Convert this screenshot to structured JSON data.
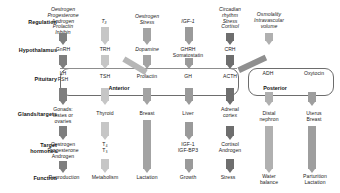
{
  "diagram": {
    "row_labels": [
      {
        "id": "regulation",
        "label": "Regulation",
        "y": 22
      },
      {
        "id": "hypothalamus",
        "label": "Hypothalamus",
        "y": 50
      },
      {
        "id": "pituitary",
        "label": "Pituitary",
        "y": 78
      },
      {
        "id": "glands",
        "label": "Glands/targets",
        "y": 113
      },
      {
        "id": "target-hormones",
        "label": "Target\nhormones",
        "y": 145
      },
      {
        "id": "function",
        "label": "Function",
        "y": 177
      }
    ],
    "boxes": [
      {
        "id": "anterior-pituitary",
        "label": "Anterior",
        "x": 60,
        "y": 68,
        "w": 177,
        "h": 26,
        "label_x": 118,
        "label_y": 86
      },
      {
        "id": "posterior-pituitary",
        "label": "Posterior",
        "x": 248,
        "y": 68,
        "w": 84,
        "h": 26,
        "label_x": 268,
        "label_y": 86
      }
    ],
    "columns": [
      {
        "id": "gonadal-axis",
        "x": 62,
        "regulation": "Oestrogen\nProgesterone\nAndrogen\nProlactin\nInhibin",
        "regulation_style": "italic",
        "hypothalamus": "GnRH",
        "pituitary": "LH\nFSH",
        "gland": "Gonads:\ntestes or\novaries",
        "target_hormone": "Oestrogen\nProgesterone\nAndrogen",
        "function": "Reproduction",
        "arrow_color": "#7e7e7e"
      },
      {
        "id": "thyroid-axis",
        "x": 104,
        "regulation": "T₃",
        "regulation_style": "italic",
        "hypothalamus": "TRH",
        "pituitary": "TSH",
        "gland": "Thyroid",
        "target_hormone": "T₄\nT₃",
        "function": "Metabolism",
        "arrow_color": "#c6c6c6"
      },
      {
        "id": "prolactin-axis",
        "x": 146,
        "regulation": "Oestrogen\nStress",
        "regulation_style": "italic",
        "hypothalamus": "Dopamine",
        "hypothalamus_style": "italic",
        "pituitary": "Prolactin",
        "gland": "Breast",
        "target_hormone": "",
        "function": "Lactation",
        "arrow_color": "#a3a3a3"
      },
      {
        "id": "growth-hormone-axis",
        "x": 188,
        "regulation": "IGF-1",
        "regulation_style": "italic",
        "hypothalamus": "GHRH\nSomatostatin",
        "pituitary": "GH",
        "gland": "Liver",
        "target_hormone": "IGF-1\nIGF-BP3",
        "function": "Growth",
        "arrow_color": "#9a9a9a"
      },
      {
        "id": "adrenal-axis",
        "x": 229,
        "regulation": "Circadian\nrhythm\nStress\nCortisol",
        "regulation_style": "italic",
        "hypothalamus": "CRH",
        "pituitary": "ACTH",
        "gland": "Adrenal\ncortex",
        "target_hormone": "Cortisol\nAndrogen",
        "function": "Stress",
        "arrow_color": "#6e6e6e"
      },
      {
        "id": "adh-axis",
        "x": 268,
        "regulation": "Osmolality\nIntravascular\nvolume",
        "regulation_style": "italic",
        "hypothalamus": "",
        "pituitary": "ADH",
        "gland": "Distal\nnephron",
        "target_hormone": "",
        "function": "Water\nbalance",
        "arrow_color": "#b0b0b0"
      },
      {
        "id": "oxytocin-axis",
        "x": 311,
        "regulation": "",
        "hypothalamus": "",
        "pituitary": "Oxytocin",
        "gland": "Uterus\nBreast",
        "target_hormone": "",
        "function": "Parturition\nLactation",
        "arrow_color": "#9e9e9e"
      }
    ],
    "diagonal_arrows": [
      {
        "id": "dopamine-to-prolactin",
        "from": "hypothalamus-dopamine",
        "to": "pituitary-prolactin"
      },
      {
        "id": "adh-to-posterior",
        "from": "hypothalamus-adh",
        "to": "posterior-pituitary"
      }
    ],
    "colors": {
      "arrow_dark": "#6e6e6e",
      "arrow_mid": "#9a9a9a",
      "arrow_light": "#c6c6c6",
      "box_stroke": "#6d6d6d",
      "text": "#1b1b1b"
    }
  }
}
